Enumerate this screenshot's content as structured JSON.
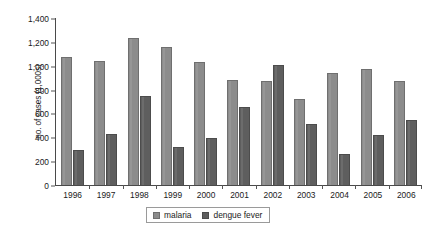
{
  "chart_data": {
    "type": "bar",
    "title": "",
    "subtitle": "",
    "xlabel": "",
    "ylabel": "no. of cases (1,000s)",
    "categories": [
      "1996",
      "1997",
      "1998",
      "1999",
      "2000",
      "2001",
      "2002",
      "2003",
      "2004",
      "2005",
      "2006"
    ],
    "series": [
      {
        "name": "malaria",
        "color": "#8c8c8c",
        "values": [
          1070,
          1040,
          1230,
          1150,
          1030,
          875,
          865,
          715,
          935,
          970,
          870
        ]
      },
      {
        "name": "dengue fever",
        "color": "#5e5e5e",
        "values": [
          290,
          425,
          740,
          315,
          395,
          650,
          1005,
          510,
          255,
          420,
          545
        ]
      }
    ],
    "ylim": [
      0,
      1400
    ],
    "ytick_values": [
      1400,
      1200,
      1000,
      800,
      600,
      400,
      200,
      0
    ],
    "ytick_labels": [
      "1,400",
      "1,200",
      "1,000",
      "800",
      "600",
      "400",
      "200",
      "0"
    ],
    "grid": false,
    "legend_position": "bottom-center",
    "legend_entries": [
      "malaria",
      "dengue fever"
    ]
  }
}
